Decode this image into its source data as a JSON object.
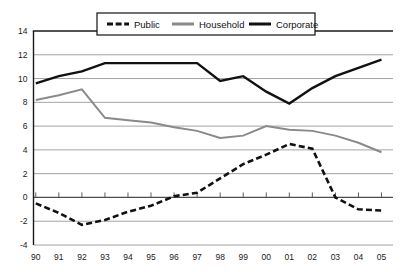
{
  "chart_data": {
    "type": "line",
    "title": "",
    "xlabel": "",
    "ylabel": "",
    "ylim": [
      -4,
      14
    ],
    "ytick_step": 2,
    "yticks": [
      "14",
      "12",
      "10",
      "8",
      "6",
      "4",
      "2",
      "0",
      "-2",
      "-4"
    ],
    "grid": true,
    "legend_position": "top-center",
    "categories": [
      "90",
      "91",
      "92",
      "93",
      "94",
      "95",
      "96",
      "97",
      "98",
      "99",
      "00",
      "01",
      "02",
      "03",
      "04",
      "05"
    ],
    "series": [
      {
        "name": "Public",
        "style": "dashed",
        "color": "#111111",
        "values": [
          -0.5,
          -1.3,
          -2.3,
          -1.9,
          -1.2,
          -0.7,
          0.1,
          0.4,
          1.6,
          2.8,
          3.6,
          4.5,
          4.1,
          0.0,
          -1.0,
          -1.1
        ]
      },
      {
        "name": "Household",
        "style": "solid",
        "color": "#8a8a8a",
        "values": [
          8.2,
          8.6,
          9.1,
          6.7,
          6.5,
          6.3,
          5.9,
          5.6,
          5.0,
          5.2,
          6.0,
          5.7,
          5.6,
          5.2,
          4.6,
          3.8
        ]
      },
      {
        "name": "Corporate",
        "style": "solid",
        "color": "#111111",
        "values": [
          9.6,
          10.2,
          10.6,
          11.3,
          11.3,
          11.3,
          11.3,
          11.3,
          9.8,
          10.2,
          8.9,
          7.9,
          9.2,
          10.2,
          10.9,
          11.6
        ]
      }
    ]
  },
  "legend": {
    "entries": [
      {
        "label": "Public"
      },
      {
        "label": "Household"
      },
      {
        "label": "Corporate"
      }
    ]
  }
}
